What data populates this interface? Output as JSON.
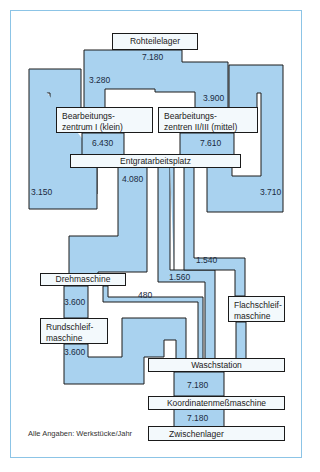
{
  "colors": {
    "flow_fill": "#a9d2ef",
    "flow_stroke": "#1a1a1a",
    "box_fill": "#f3f9fc",
    "frame": "#8cc4e6"
  },
  "nodes": {
    "rohteilelager": "Rohteilelager",
    "bz1_line1": "Bearbeitungs-",
    "bz1_line2": "zentrum I (klein)",
    "bz23_line1": "Bearbeitungs-",
    "bz23_line2": "zentren II/III (mittel)",
    "entgrat": "Entgratarbeitsplatz",
    "dreh": "Drehmaschine",
    "rund_line1": "Rundschleif-",
    "rund_line2": "maschine",
    "flach_line1": "Flachschleif-",
    "flach_line2": "maschine",
    "wasch": "Waschstation",
    "koord": "Koordinatenmeßmaschine",
    "zwischen": "Zwischenlager"
  },
  "flows": {
    "roh_out": "7.180",
    "to_bz1": "3.280",
    "to_bz23": "3.900",
    "bz1_to_entgrat": "6.430",
    "bz23_to_entgrat": "7.610",
    "loop_left": "3.150",
    "loop_right": "3.710",
    "entgrat_to_dreh": "4.080",
    "entgrat_to_wasch": "1.560",
    "entgrat_to_flach": "1.540",
    "dreh_to_wasch": "480",
    "dreh_to_rund": "3.600",
    "rund_to_wasch": "3.600",
    "wasch_to_koord": "7.180",
    "koord_to_zwischen": "7.180"
  },
  "note": "Alle Angaben: Werkstücke/Jahr"
}
